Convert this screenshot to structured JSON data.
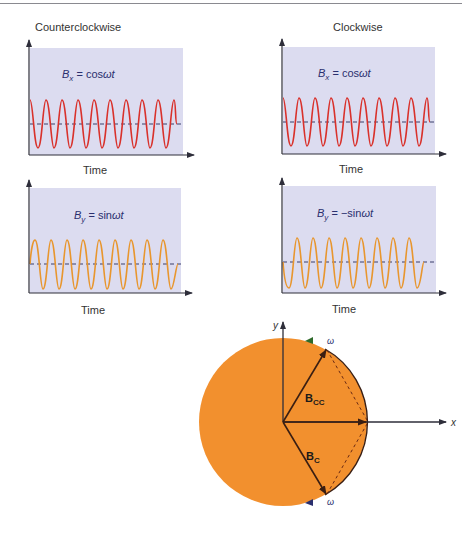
{
  "figure": {
    "colors": {
      "plot_background": "#dcdcf0",
      "cos_wave": "#d9312b",
      "sin_wave": "#e8962e",
      "dashed_baseline": "#3a3f6a",
      "axis": "#2e2e3a",
      "disc_fill": "#f2902e",
      "equation_text": "#2a2f6e"
    },
    "columns": [
      {
        "title": "Counterclockwise"
      },
      {
        "title": "Clockwise"
      }
    ],
    "panels": [
      {
        "id": "ccw-bx",
        "equation_lhs": "B",
        "equation_sub": "x",
        "equation_rhs": "= cosωt",
        "xlabel": "Time",
        "wave": "cos"
      },
      {
        "id": "cw-bx",
        "equation_lhs": "B",
        "equation_sub": "x",
        "equation_rhs": "= cosωt",
        "xlabel": "Time",
        "wave": "cos"
      },
      {
        "id": "ccw-by",
        "equation_lhs": "B",
        "equation_sub": "y",
        "equation_rhs": "= sinωt",
        "xlabel": "Time",
        "wave": "sin"
      },
      {
        "id": "cw-by",
        "equation_lhs": "B",
        "equation_sub": "y",
        "equation_rhs": "= −sinωt",
        "xlabel": "Time",
        "wave": "-sin"
      }
    ],
    "phasor": {
      "x_axis_label": "x",
      "y_axis_label": "y",
      "vector_cc_label": "B",
      "vector_cc_sub": "CC",
      "vector_c_label": "B",
      "vector_c_sub": "C",
      "omega_top": "ω",
      "omega_bottom": "ω"
    }
  }
}
